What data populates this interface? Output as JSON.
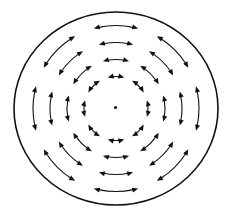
{
  "diagram": {
    "title": "",
    "canvas": {
      "width": 227,
      "height": 215,
      "background": "#ffffff"
    },
    "boundary": {
      "shape": "circle",
      "cx": 116,
      "cy": 108.5,
      "rx": 102,
      "ry": 96.5,
      "stroke": "#111111",
      "stroke_width": 1.6
    },
    "center_point": {
      "cx": 115.5,
      "cy": 107.5,
      "r": 1.6,
      "fill": "#111111"
    },
    "arrow_style": {
      "type": "double-headed-arc",
      "stroke": "#111111",
      "stroke_width": 1.1,
      "head_length": 6,
      "head_width": 5
    },
    "rings": [
      {
        "name": "ring-1-inner",
        "radius": 32,
        "arc_span_deg": 30,
        "count": 8
      },
      {
        "name": "ring-2",
        "radius": 49,
        "arc_span_deg": 31,
        "count": 8
      },
      {
        "name": "ring-3",
        "radius": 66,
        "arc_span_deg": 30,
        "count": 8
      },
      {
        "name": "ring-4-outer",
        "radius": 83,
        "arc_span_deg": 31,
        "count": 8
      }
    ],
    "arrow_angles_deg": [
      0,
      45,
      90,
      135,
      180,
      225,
      270,
      315
    ]
  }
}
